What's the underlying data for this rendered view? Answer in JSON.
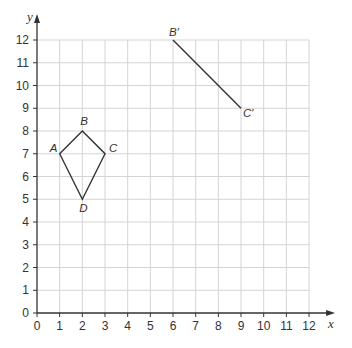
{
  "chart_data": {
    "type": "coordinate-grid",
    "title": "",
    "xlabel": "x",
    "ylabel": "y",
    "xlim": [
      0,
      12
    ],
    "ylim": [
      0,
      12
    ],
    "x_ticks": [
      0,
      1,
      2,
      3,
      4,
      5,
      6,
      7,
      8,
      9,
      10,
      11,
      12
    ],
    "y_ticks": [
      0,
      1,
      2,
      3,
      4,
      5,
      6,
      7,
      8,
      9,
      10,
      11,
      12
    ],
    "grid": true,
    "shapes": [
      {
        "name": "kite ABCD",
        "type": "polygon",
        "points": [
          {
            "label": "A",
            "x": 1,
            "y": 7
          },
          {
            "label": "B",
            "x": 2,
            "y": 8
          },
          {
            "label": "C",
            "x": 3,
            "y": 7
          },
          {
            "label": "D",
            "x": 2,
            "y": 5
          }
        ]
      },
      {
        "name": "segment B'C'",
        "type": "segment",
        "points": [
          {
            "label": "B′",
            "x": 6,
            "y": 12
          },
          {
            "label": "C′",
            "x": 9,
            "y": 9
          }
        ]
      }
    ]
  },
  "colors": {
    "grid": "#d4d4d4",
    "axis": "#333333",
    "shape": "#333333",
    "text": "#333333"
  },
  "layout": {
    "origin_px": [
      37,
      313
    ],
    "unit_px_x": 22.67,
    "unit_px_y": 22.75
  }
}
